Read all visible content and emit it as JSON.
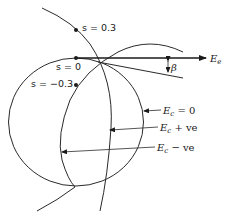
{
  "diagram": {
    "points": [
      {
        "label": "s = 0.3",
        "var": "s",
        "value": "0.3"
      },
      {
        "label": "s = 0",
        "var": "s",
        "value": "0"
      },
      {
        "label": "s = −0.3",
        "var": "s",
        "value": "−0.3"
      }
    ],
    "axis": {
      "label_main": "E",
      "label_sub": "e"
    },
    "angle": {
      "label": "β"
    },
    "curves": [
      {
        "label_main": "E",
        "label_sub": "c",
        "label_rest": " = 0"
      },
      {
        "label_main": "E",
        "label_sub": "c",
        "label_rest": " + ve"
      },
      {
        "label_main": "E",
        "label_sub": "c",
        "label_rest": " − ve"
      }
    ],
    "colors": {
      "ink": "#1a1a1a",
      "background": "#ffffff"
    }
  }
}
